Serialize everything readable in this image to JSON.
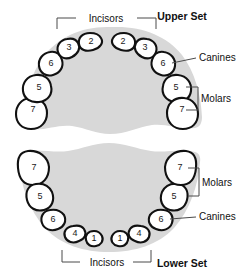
{
  "diagram": {
    "title_upper": "Upper Set",
    "title_lower": "Lower Set",
    "labels": {
      "incisors_upper": "Incisors",
      "canines_upper": "Canines",
      "molars_upper": "Molars",
      "incisors_lower": "Incisors",
      "canines_lower": "Canines",
      "molars_lower": "Molars"
    },
    "colors": {
      "arch_fill": "#d8d8d8",
      "tooth_fill": "#ffffff",
      "tooth_outline": "#111111",
      "leader_line": "#4a4a4a",
      "text": "#111111",
      "background": "#ffffff"
    },
    "upper_set": {
      "name": "Upper Set",
      "teeth": [
        {
          "number": "2",
          "side": "left",
          "group": "incisors",
          "cx": 92,
          "cy": 41
        },
        {
          "number": "2",
          "side": "right",
          "group": "incisors",
          "cx": 122,
          "cy": 41
        },
        {
          "number": "3",
          "side": "left",
          "group": "incisors",
          "cx": 69,
          "cy": 48
        },
        {
          "number": "3",
          "side": "right",
          "group": "incisors",
          "cx": 145,
          "cy": 48
        },
        {
          "number": "6",
          "side": "left",
          "group": "canines",
          "cx": 52,
          "cy": 62
        },
        {
          "number": "6",
          "side": "right",
          "group": "canines",
          "cx": 162,
          "cy": 62
        },
        {
          "number": "5",
          "side": "left",
          "group": "molars",
          "cx": 39,
          "cy": 86
        },
        {
          "number": "5",
          "side": "right",
          "group": "molars",
          "cx": 175,
          "cy": 86
        },
        {
          "number": "7",
          "side": "left",
          "group": "molars",
          "cx": 33,
          "cy": 110
        },
        {
          "number": "7",
          "side": "right",
          "group": "molars",
          "cx": 181,
          "cy": 110
        }
      ]
    },
    "lower_set": {
      "name": "Lower Set",
      "teeth": [
        {
          "number": "7",
          "side": "left",
          "group": "molars",
          "cx": 35,
          "cy": 167
        },
        {
          "number": "7",
          "side": "right",
          "group": "molars",
          "cx": 179,
          "cy": 167
        },
        {
          "number": "5",
          "side": "left",
          "group": "molars",
          "cx": 41,
          "cy": 196
        },
        {
          "number": "5",
          "side": "right",
          "group": "molars",
          "cx": 173,
          "cy": 196
        },
        {
          "number": "6",
          "side": "left",
          "group": "canines",
          "cx": 54,
          "cy": 219
        },
        {
          "number": "6",
          "side": "right",
          "group": "canines",
          "cx": 160,
          "cy": 219
        },
        {
          "number": "4",
          "side": "left",
          "group": "incisors",
          "cx": 76,
          "cy": 233
        },
        {
          "number": "4",
          "side": "right",
          "group": "incisors",
          "cx": 138,
          "cy": 233
        },
        {
          "number": "1",
          "side": "left",
          "group": "incisors",
          "cx": 95,
          "cy": 238
        },
        {
          "number": "1",
          "side": "right",
          "group": "incisors",
          "cx": 119,
          "cy": 238
        }
      ]
    }
  }
}
